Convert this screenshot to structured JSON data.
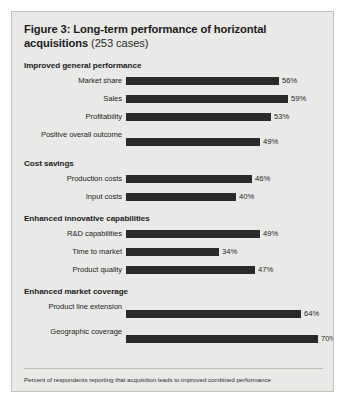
{
  "figure": {
    "title_main": "Figure 3: Long-term performance of horizontal acquisitions",
    "title_sub": "(253 cases)",
    "footnote": "Percent of respondents reporting that acquisition leads to improved combined performance"
  },
  "chart_data": {
    "type": "bar",
    "orientation": "horizontal",
    "title": "Figure 3: Long-term performance of horizontal acquisitions (253 cases)",
    "subtitle": "(253 cases)",
    "xlabel": "",
    "ylabel": "",
    "xlim": [
      0,
      100
    ],
    "grid": false,
    "legend": false,
    "value_suffix": "%",
    "bar_color": "#2a2a2a",
    "panel_color": "#e9e9e7",
    "n_cases": 253,
    "annotation": "Percent of respondents reporting that acquisition leads to improved combined performance",
    "groups": [
      {
        "name": "Improved general performance",
        "categories": [
          "Market share",
          "Sales",
          "Profitability",
          "Positive overall outcome"
        ],
        "values": [
          56,
          59,
          53,
          49
        ],
        "labels": [
          "56%",
          "59%",
          "53%",
          "49%"
        ]
      },
      {
        "name": "Cost savings",
        "categories": [
          "Production costs",
          "Input costs"
        ],
        "values": [
          46,
          40
        ],
        "labels": [
          "46%",
          "40%"
        ]
      },
      {
        "name": "Enhanced innovative capabilities",
        "categories": [
          "R&D capabilities",
          "Time to market",
          "Product quality"
        ],
        "values": [
          49,
          34,
          47
        ],
        "labels": [
          "49%",
          "34%",
          "47%"
        ]
      },
      {
        "name": "Enhanced market coverage",
        "categories": [
          "Product line extension",
          "Geographic coverage"
        ],
        "values": [
          64,
          70
        ],
        "labels": [
          "64%",
          "70%"
        ]
      }
    ]
  }
}
